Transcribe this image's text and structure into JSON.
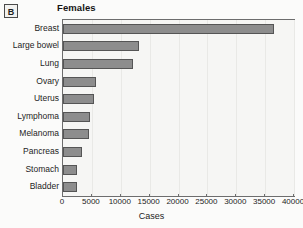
{
  "panel": {
    "letter": "B"
  },
  "chart_data": {
    "type": "bar",
    "orientation": "horizontal",
    "title": "Females",
    "xlabel": "Cases",
    "ylabel": "",
    "xlim": [
      0,
      40000
    ],
    "xticks": [
      "0",
      "5000",
      "10000",
      "15000",
      "20000",
      "25000",
      "30000",
      "35000",
      "40000"
    ],
    "xtick_values": [
      0,
      5000,
      10000,
      15000,
      20000,
      25000,
      30000,
      35000,
      40000
    ],
    "grid": "vertical-light",
    "legend": "none",
    "bar_color": "#8d8d8d",
    "bar_edge_color": "#555555",
    "plot_background": "#f6f6f4",
    "categories": [
      "Breast",
      "Large bowel",
      "Lung",
      "Ovary",
      "Uterus",
      "Lymphoma",
      "Melanoma",
      "Pancreas",
      "Stomach",
      "Bladder"
    ],
    "values": [
      36500,
      13200,
      12200,
      5700,
      5400,
      4700,
      4500,
      3300,
      2400,
      2400
    ]
  }
}
